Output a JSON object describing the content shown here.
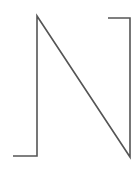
{
  "diagram": {
    "stroke_color": "#555555",
    "background_color": "#ffffff",
    "stroke_width": 1.6,
    "path_points": [
      [
        13,
        156
      ],
      [
        37,
        156
      ],
      [
        37,
        16
      ],
      [
        130,
        157
      ],
      [
        130,
        18
      ],
      [
        108,
        18
      ]
    ]
  }
}
